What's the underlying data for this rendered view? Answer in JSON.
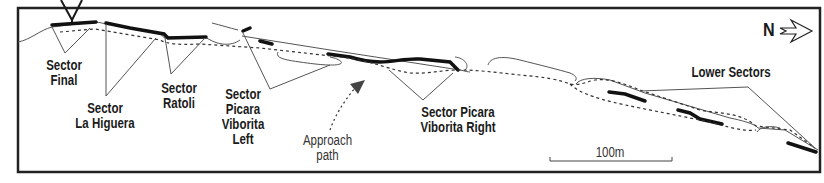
{
  "diagram": {
    "type": "crag-topo-overview",
    "colors": {
      "ink": "#1a1a1a",
      "frame": "#222222",
      "background": "#ffffff"
    },
    "sectors": [
      {
        "id": "final",
        "label_line1": "Sector",
        "label_line2": "Final"
      },
      {
        "id": "la-higuera",
        "label_line1": "Sector",
        "label_line2": "La Higuera"
      },
      {
        "id": "ratoli",
        "label_line1": "Sector",
        "label_line2": "Ratoli"
      },
      {
        "id": "picara-viborita-left",
        "label_line1": "Sector",
        "label_line2": "Picara",
        "label_line3": "Viborita",
        "label_line4": "Left"
      },
      {
        "id": "picara-viborita-right",
        "label_line1": "Sector Picara",
        "label_line2": "Viborita Right"
      },
      {
        "id": "lower-sectors",
        "label_line1": "Lower Sectors"
      }
    ],
    "approach": {
      "label_line1": "Approach",
      "label_line2": "path"
    },
    "scale_bar": {
      "label": "100m"
    },
    "north_arrow": {
      "label": "N",
      "icon": "north-arrow-icon"
    }
  }
}
